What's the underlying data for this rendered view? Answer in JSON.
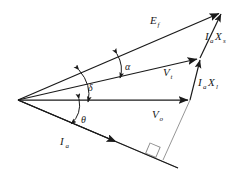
{
  "diagram": {
    "type": "phasor-diagram",
    "background": "#ffffff",
    "stroke_color": "#1a1a1a",
    "thin_stroke_color": "#888888",
    "width": 250,
    "height": 174,
    "origin": {
      "x": 18,
      "y": 100
    },
    "phasors": [
      {
        "name": "excitation-voltage",
        "symbol": "E",
        "subscript": "f",
        "label_x": 150,
        "label_y": 24,
        "from": {
          "x": 18,
          "y": 100
        },
        "to": {
          "x": 222,
          "y": 12
        },
        "arrow": "tip"
      },
      {
        "name": "terminal-voltage",
        "symbol": "V",
        "subscript": "t",
        "label_x": 163,
        "label_y": 76,
        "from": {
          "x": 18,
          "y": 100
        },
        "to": {
          "x": 200,
          "y": 58
        },
        "arrow": "tip"
      },
      {
        "name": "output-voltage",
        "symbol": "V",
        "subscript": "o",
        "label_x": 152,
        "label_y": 118,
        "from": {
          "x": 18,
          "y": 100
        },
        "to": {
          "x": 190,
          "y": 100
        },
        "arrow": "tip"
      },
      {
        "name": "armature-current",
        "symbol": "I",
        "subscript": "a",
        "label_x": 60,
        "label_y": 145,
        "from": {
          "x": 18,
          "y": 100
        },
        "to": {
          "x": 178,
          "y": 168
        },
        "arrow": "mid"
      }
    ],
    "drops": [
      {
        "name": "synchronous-reactance-drop",
        "symbol": "I",
        "subscript1": "a",
        "symbol2": "X",
        "subscript2": "s",
        "label_x": 205,
        "label_y": 40,
        "from": {
          "x": 200,
          "y": 58
        },
        "to": {
          "x": 222,
          "y": 12
        },
        "arrow": "tip"
      },
      {
        "name": "leakage-reactance-drop",
        "symbol": "I",
        "subscript1": "a",
        "symbol2": "X",
        "subscript2": "l",
        "label_x": 198,
        "label_y": 86,
        "from": {
          "x": 190,
          "y": 100
        },
        "to": {
          "x": 200,
          "y": 58
        },
        "arrow": "tip"
      }
    ],
    "angles": [
      {
        "name": "alpha-angle",
        "symbol": "α",
        "label_x": 125,
        "label_y": 66,
        "between": "Ef-and-Vt",
        "arc_from": {
          "x": 118,
          "y": 56
        },
        "arc_to": {
          "x": 121,
          "y": 76
        }
      },
      {
        "name": "delta-angle",
        "symbol": "δ",
        "label_x": 87,
        "label_y": 88,
        "between": "Vt-and-Vo",
        "arc_from": {
          "x": 80,
          "y": 72
        },
        "arc_to": {
          "x": 89,
          "y": 100
        }
      },
      {
        "name": "theta-angle",
        "symbol": "θ",
        "label_x": 82,
        "label_y": 122,
        "between": "Vo-and-Ia",
        "arc_from": {
          "x": 78,
          "y": 100
        },
        "arc_to": {
          "x": 70,
          "y": 122
        }
      }
    ],
    "right_angle": {
      "name": "right-angle-marker",
      "x": 150,
      "y": 143,
      "size": 11,
      "rotation": 23
    },
    "construction_lines": [
      {
        "name": "perpendicular-drop-line",
        "from": {
          "x": 190,
          "y": 100
        },
        "to": {
          "x": 163,
          "y": 160
        }
      },
      {
        "name": "armature-baseline",
        "from": {
          "x": 18,
          "y": 100
        },
        "to": {
          "x": 178,
          "y": 168
        }
      }
    ]
  }
}
